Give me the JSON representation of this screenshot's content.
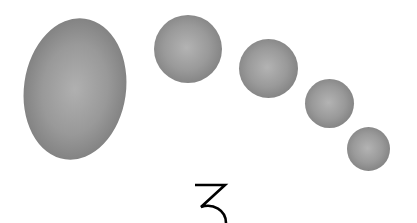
{
  "figure": {
    "shapes": [
      {
        "id": "ellipse-large",
        "kind": "ellipse",
        "cx": 75,
        "cy": 89,
        "rx": 51,
        "ry": 71
      },
      {
        "id": "sphere-1",
        "kind": "circle",
        "cx": 188,
        "cy": 49,
        "r": 34
      },
      {
        "id": "sphere-2",
        "kind": "circle",
        "cx": 268,
        "cy": 68,
        "r": 29
      },
      {
        "id": "sphere-3",
        "kind": "circle",
        "cx": 329,
        "cy": 103,
        "r": 24
      },
      {
        "id": "sphere-4",
        "kind": "circle",
        "cx": 368,
        "cy": 149,
        "r": 21
      }
    ],
    "label": "3",
    "colors": {
      "background": "#ffffff",
      "shape_center": "#b0b0b0",
      "shape_edge": "#6e6e6e",
      "label": "#000000"
    }
  }
}
